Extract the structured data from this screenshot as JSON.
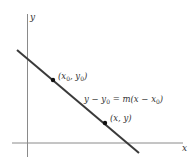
{
  "diagram": {
    "type": "point-slope-line",
    "axes": {
      "x_label": "x",
      "y_label": "y",
      "color": "#8a8a8a"
    },
    "line": {
      "color": "#3a3a3a",
      "from": [
        17,
        50
      ],
      "to": [
        139,
        153
      ]
    },
    "points": [
      {
        "label_main": "(x",
        "label_sub1": "0",
        "label_mid": ", y",
        "label_sub2": "0",
        "label_end": ")",
        "at": [
          53,
          80
        ]
      },
      {
        "label": "(x, y)",
        "at": [
          105,
          123
        ]
      }
    ],
    "equation": {
      "lhs_a": "y − y",
      "lhs_sub": "0",
      "mid": " = m(x − x",
      "rhs_sub": "0",
      "end": ")"
    }
  }
}
